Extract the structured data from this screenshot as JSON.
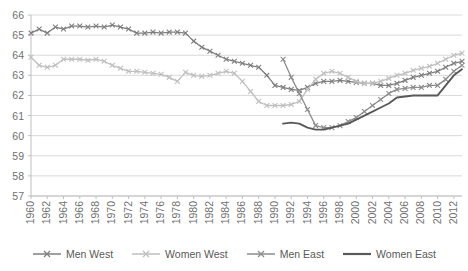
{
  "chart_data": {
    "type": "line",
    "title": "",
    "subtitle": "",
    "xlabel": "",
    "ylabel": "",
    "xlim": [
      1960,
      2013
    ],
    "ylim": [
      57,
      66
    ],
    "y_ticks": [
      57,
      58,
      59,
      60,
      61,
      62,
      63,
      64,
      65,
      66
    ],
    "x_ticks": [
      1960,
      1962,
      1964,
      1966,
      1968,
      1970,
      1972,
      1974,
      1976,
      1978,
      1980,
      1982,
      1984,
      1986,
      1988,
      1990,
      1992,
      1994,
      1996,
      1998,
      2000,
      2002,
      2004,
      2006,
      2008,
      2010,
      2012
    ],
    "x_tick_labels": [
      "1960",
      "1962",
      "1964",
      "1966",
      "1968",
      "1970",
      "1972",
      "1974",
      "1976",
      "1978",
      "1980",
      "1982",
      "1984",
      "1986",
      "1988",
      "1990",
      "1992",
      "1994",
      "1996",
      "1998",
      "2000",
      "2002",
      "2004",
      "2006",
      "2008",
      "2010",
      "2012"
    ],
    "y_tick_labels": [
      "57",
      "58",
      "59",
      "60",
      "61",
      "62",
      "63",
      "64",
      "65",
      "66"
    ],
    "grid": "horizontal",
    "legend_position": "bottom",
    "series": [
      {
        "name": "Men West",
        "color": "#7F7F7F",
        "marker": "x",
        "x": [
          1960,
          1961,
          1962,
          1963,
          1964,
          1965,
          1966,
          1967,
          1968,
          1969,
          1970,
          1971,
          1972,
          1973,
          1974,
          1975,
          1976,
          1977,
          1978,
          1979,
          1980,
          1981,
          1982,
          1983,
          1984,
          1985,
          1986,
          1987,
          1988,
          1989,
          1990,
          1991,
          1992,
          1993,
          1994,
          1995,
          1996,
          1997,
          1998,
          1999,
          2000,
          2001,
          2002,
          2003,
          2004,
          2005,
          2006,
          2007,
          2008,
          2009,
          2010,
          2011,
          2012,
          2013
        ],
        "values": [
          65.1,
          65.3,
          65.1,
          65.4,
          65.3,
          65.45,
          65.45,
          65.4,
          65.45,
          65.4,
          65.5,
          65.4,
          65.3,
          65.1,
          65.1,
          65.15,
          65.1,
          65.15,
          65.15,
          65.1,
          64.7,
          64.4,
          64.2,
          64.0,
          63.8,
          63.7,
          63.6,
          63.5,
          63.4,
          63.0,
          62.5,
          62.4,
          62.3,
          62.25,
          62.4,
          62.6,
          62.7,
          62.7,
          62.75,
          62.7,
          62.65,
          62.6,
          62.6,
          62.5,
          62.5,
          62.6,
          62.75,
          62.9,
          63.0,
          63.1,
          63.2,
          63.4,
          63.6,
          63.7
        ]
      },
      {
        "name": "Women West",
        "color": "#BFBFBF",
        "marker": "x",
        "x": [
          1960,
          1961,
          1962,
          1963,
          1964,
          1965,
          1966,
          1967,
          1968,
          1969,
          1970,
          1971,
          1972,
          1973,
          1974,
          1975,
          1976,
          1977,
          1978,
          1979,
          1980,
          1981,
          1982,
          1983,
          1984,
          1985,
          1986,
          1987,
          1988,
          1989,
          1990,
          1991,
          1992,
          1993,
          1994,
          1995,
          1996,
          1997,
          1998,
          1999,
          2000,
          2001,
          2002,
          2003,
          2004,
          2005,
          2006,
          2007,
          2008,
          2009,
          2010,
          2011,
          2012,
          2013
        ],
        "values": [
          63.9,
          63.5,
          63.4,
          63.5,
          63.8,
          63.8,
          63.8,
          63.75,
          63.8,
          63.7,
          63.5,
          63.35,
          63.2,
          63.2,
          63.15,
          63.1,
          63.05,
          62.9,
          62.7,
          63.15,
          63.0,
          62.95,
          63.0,
          63.1,
          63.2,
          63.1,
          62.7,
          62.2,
          61.7,
          61.5,
          61.5,
          61.5,
          61.55,
          61.7,
          62.3,
          62.8,
          63.1,
          63.2,
          63.1,
          62.9,
          62.7,
          62.6,
          62.6,
          62.7,
          62.85,
          63.0,
          63.1,
          63.25,
          63.35,
          63.45,
          63.6,
          63.8,
          64.0,
          64.1
        ]
      },
      {
        "name": "Men East",
        "color": "#8C8C8C",
        "marker": "x",
        "x": [
          1991,
          1992,
          1993,
          1994,
          1995,
          1996,
          1997,
          1998,
          1999,
          2000,
          2001,
          2002,
          2003,
          2004,
          2005,
          2006,
          2007,
          2008,
          2009,
          2010,
          2011,
          2012,
          2013
        ],
        "values": [
          63.8,
          62.9,
          62.1,
          61.3,
          60.5,
          60.4,
          60.4,
          60.5,
          60.7,
          60.9,
          61.2,
          61.5,
          61.8,
          62.1,
          62.3,
          62.35,
          62.4,
          62.4,
          62.5,
          62.5,
          62.8,
          63.2,
          63.5
        ]
      },
      {
        "name": "Women East",
        "color": "#595959",
        "marker": "none",
        "x": [
          1991,
          1992,
          1993,
          1994,
          1995,
          1996,
          1997,
          1998,
          1999,
          2000,
          2001,
          2002,
          2003,
          2004,
          2005,
          2006,
          2007,
          2008,
          2009,
          2010,
          2011,
          2012,
          2013
        ],
        "values": [
          60.6,
          60.65,
          60.6,
          60.4,
          60.3,
          60.3,
          60.4,
          60.5,
          60.6,
          60.8,
          61.0,
          61.2,
          61.4,
          61.6,
          61.9,
          61.95,
          62.0,
          62.0,
          62.0,
          62.0,
          62.5,
          63.0,
          63.3
        ]
      }
    ]
  },
  "legend": {
    "items": [
      {
        "label": "Men West",
        "color": "#7F7F7F",
        "marker": "x"
      },
      {
        "label": "Women West",
        "color": "#BFBFBF",
        "marker": "x"
      },
      {
        "label": "Men East",
        "color": "#8C8C8C",
        "marker": "x"
      },
      {
        "label": "Women East",
        "color": "#595959",
        "marker": "none"
      }
    ]
  },
  "axes": {
    "grid_color": "#D9D9D9",
    "axis_color": "#BFBFBF",
    "tick_text_color": "#707070"
  }
}
